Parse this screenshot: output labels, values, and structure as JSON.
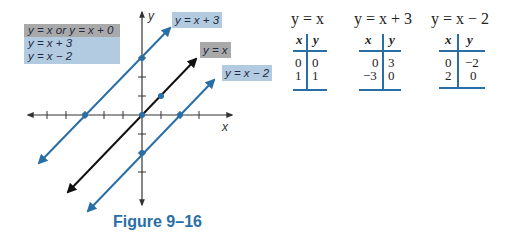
{
  "legend": {
    "rows": [
      "y = x  or  y = x + 0",
      "y = x + 3",
      "y = x − 2"
    ]
  },
  "graph": {
    "x_axis_label": "x",
    "y_axis_label": "y",
    "line_labels": {
      "plus3": "y = x + 3",
      "identity": "y = x",
      "minus2": "y = x − 2"
    },
    "colors": {
      "blue": "#2a6ea6",
      "black": "#111111",
      "label_blue": "#b3cbe0",
      "label_gray": "#a9a9a9"
    }
  },
  "tables": [
    {
      "title": "y = x",
      "headers": [
        "x",
        "y"
      ],
      "rows": [
        [
          "0",
          "0"
        ],
        [
          "1",
          "1"
        ]
      ]
    },
    {
      "title": "y = x + 3",
      "headers": [
        "x",
        "y"
      ],
      "rows": [
        [
          "0",
          "3"
        ],
        [
          "−3",
          "0"
        ]
      ]
    },
    {
      "title": "y = x − 2",
      "headers": [
        "x",
        "y"
      ],
      "rows": [
        [
          "0",
          "−2"
        ],
        [
          "2",
          "0"
        ]
      ]
    }
  ],
  "caption": "Figure 9–16"
}
